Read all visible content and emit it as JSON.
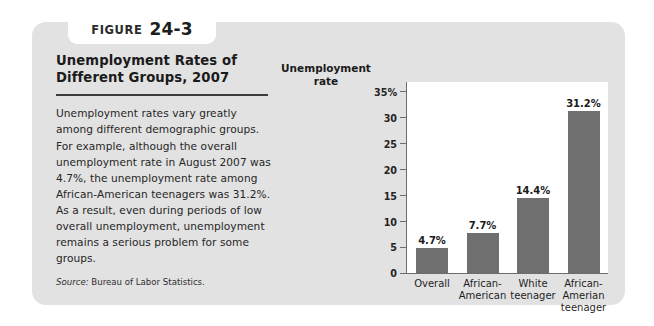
{
  "figure": {
    "tab_word": "Figure",
    "tab_number": "24-3",
    "title": "Unemployment Rates of Different Groups, 2007",
    "body": "Unemployment rates vary greatly among different demographic groups. For example, although the overall unemployment rate in August 2007 was 4.7%, the unemployment rate among African-American teenagers was 31.2%. As a result, even during periods of low overall unemployment, unemployment remains a serious problem for some groups.",
    "source_label": "Source:",
    "source_text": "Bureau of Labor Statistics."
  },
  "colors": {
    "card_background": "#e2e2e2",
    "bar_fill": "#6f6f6f",
    "plot_background": "#ffffff",
    "axis_line": "#6d6d6d",
    "title_rule": "#3c3c3c"
  },
  "chart_data": {
    "type": "bar",
    "title": "Unemployment Rates of Different Groups, 2007",
    "xlabel": "",
    "ylabel": "Unemployment rate",
    "ylabel_lines": [
      "Unemployment",
      "rate"
    ],
    "categories": [
      "Overall",
      "African-American",
      "White teenager",
      "African-Amerian teenager"
    ],
    "category_lines": [
      [
        "Overall"
      ],
      [
        "African-",
        "American"
      ],
      [
        "White",
        "teenager"
      ],
      [
        "African-",
        "Amerian",
        "teenager"
      ]
    ],
    "values": [
      4.7,
      7.7,
      14.4,
      31.2
    ],
    "value_labels": [
      "4.7%",
      "7.7%",
      "14.4%",
      "31.2%"
    ],
    "ylim": [
      0,
      37
    ],
    "yticks": [
      0,
      5,
      10,
      15,
      20,
      25,
      30,
      35
    ],
    "ytick_labels": [
      "0",
      "5",
      "10",
      "15",
      "20",
      "25",
      "30",
      "35%"
    ],
    "grid": false,
    "legend": "none",
    "source": "Bureau of Labor Statistics."
  }
}
